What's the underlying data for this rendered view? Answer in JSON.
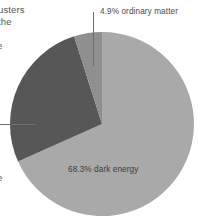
{
  "chart_data": {
    "type": "pie",
    "title": "",
    "categories": [
      "dark energy",
      "dark matter",
      "ordinary matter"
    ],
    "values": [
      68.3,
      26.8,
      4.9
    ],
    "labels": [
      "68.3% dark energy",
      "",
      "4.9% ordinary matter"
    ],
    "colors": [
      "#a9a9a9",
      "#575757",
      "#8f8f8f"
    ],
    "units": "percent",
    "legend": "none",
    "grid": false,
    "start_angle_deg": 0,
    "direction": "clockwise",
    "center": {
      "x": 102,
      "y": 124
    },
    "radius": 92
  },
  "labels": {
    "ordinary_matter": "4.9% ordinary matter",
    "dark_energy": "68.3% dark energy"
  },
  "cropped_caption": {
    "line1": "usters",
    "line2": "the",
    "line3": "e",
    "line4": "e"
  },
  "colors": {
    "slice_dark_energy": "#a9a9a9",
    "slice_dark_matter": "#575757",
    "slice_ordinary_matter": "#8f8f8f",
    "leader_line": "#6e6e6e",
    "text": "#4a4a4a",
    "background": "#ffffff"
  }
}
